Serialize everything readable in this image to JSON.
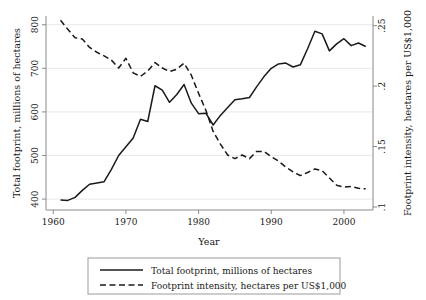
{
  "chart_data": {
    "type": "line",
    "title": "",
    "xlabel": "Year",
    "ylabel": "Total footprint, millions of hectares",
    "y2label": "Footprint intensity, hectares per US$1,000",
    "xlim": [
      1959,
      2004
    ],
    "ylim": [
      375,
      820
    ],
    "y2lim": [
      0.0975,
      0.258
    ],
    "grid": true,
    "legend_position": "bottom-center",
    "xticks": [
      1960,
      1970,
      1980,
      1990,
      2000
    ],
    "xtick_labels": [
      "1960",
      "1970",
      "1980",
      "1990",
      "2000"
    ],
    "yticks": [
      400,
      500,
      600,
      700,
      800
    ],
    "ytick_labels": [
      "400",
      "500",
      "600",
      "700",
      "800"
    ],
    "y2ticks": [
      0.1,
      0.15,
      0.2,
      0.25
    ],
    "y2tick_labels": [
      ".1",
      ".15",
      ".2",
      ".25"
    ],
    "x": [
      1961,
      1962,
      1963,
      1964,
      1965,
      1966,
      1967,
      1968,
      1969,
      1970,
      1971,
      1972,
      1973,
      1974,
      1975,
      1976,
      1977,
      1978,
      1979,
      1980,
      1981,
      1982,
      1983,
      1984,
      1985,
      1986,
      1987,
      1988,
      1989,
      1990,
      1991,
      1992,
      1993,
      1994,
      1995,
      1996,
      1997,
      1998,
      1999,
      2000,
      2001,
      2002,
      2003
    ],
    "series": [
      {
        "name": "Total footprint, millions of hectares",
        "axis": "left",
        "style": "solid",
        "color": "#1a1a1a",
        "values": [
          398,
          397,
          404,
          420,
          434,
          437,
          440,
          468,
          500,
          520,
          540,
          583,
          578,
          660,
          650,
          622,
          640,
          663,
          620,
          596,
          597,
          570,
          592,
          610,
          628,
          630,
          633,
          658,
          681,
          700,
          710,
          712,
          703,
          708,
          745,
          785,
          779,
          740,
          756,
          768,
          752,
          758,
          750
        ]
      },
      {
        "name": "Footprint intensity, hectares per US$1,000",
        "axis": "right",
        "style": "dashed",
        "color": "#1a1a1a",
        "values": [
          0.2545,
          0.247,
          0.24,
          0.239,
          0.232,
          0.228,
          0.225,
          0.2215,
          0.215,
          0.223,
          0.211,
          0.208,
          0.2125,
          0.2195,
          0.215,
          0.212,
          0.214,
          0.219,
          0.209,
          0.194,
          0.18,
          0.1625,
          0.152,
          0.143,
          0.14,
          0.143,
          0.14,
          0.146,
          0.146,
          0.1415,
          0.138,
          0.133,
          0.129,
          0.126,
          0.1285,
          0.1315,
          0.13,
          0.124,
          0.118,
          0.1165,
          0.117,
          0.1155,
          0.115
        ]
      }
    ]
  },
  "legend": {
    "items": [
      {
        "label": "Total footprint, millions of hectares",
        "style": "solid"
      },
      {
        "label": "Footprint intensity, hectares per US$1,000",
        "style": "dashed"
      }
    ]
  }
}
